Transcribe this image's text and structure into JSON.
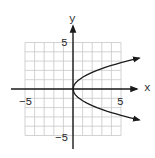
{
  "chart_data": {
    "type": "line",
    "title": "",
    "xlabel": "x",
    "ylabel": "y",
    "xlim": [
      -5,
      5
    ],
    "ylim": [
      -5,
      5
    ],
    "grid": true,
    "grid_step": 1,
    "x_tick_labels": [
      {
        "value": -5,
        "label": "−5"
      },
      {
        "value": 5,
        "label": "5"
      }
    ],
    "y_tick_labels": [
      {
        "value": 5,
        "label": "5"
      },
      {
        "value": -5,
        "label": "−5"
      }
    ],
    "series": [
      {
        "name": "parabola opening right (y² ≈ 1.6x)",
        "branches": [
          {
            "name": "upper-branch",
            "points": [
              [
                0,
                0
              ],
              [
                0.1,
                0.4
              ],
              [
                0.25,
                0.63
              ],
              [
                0.5,
                0.89
              ],
              [
                1,
                1.26
              ],
              [
                1.5,
                1.55
              ],
              [
                2,
                1.79
              ],
              [
                2.5,
                2.0
              ],
              [
                3,
                2.19
              ],
              [
                3.5,
                2.37
              ],
              [
                4,
                2.53
              ],
              [
                4.5,
                2.68
              ],
              [
                5,
                2.83
              ],
              [
                5.5,
                2.97
              ],
              [
                6,
                3.1
              ],
              [
                6.9,
                3.32
              ]
            ],
            "arrow_end": true
          },
          {
            "name": "lower-branch",
            "points": [
              [
                0,
                0
              ],
              [
                0.1,
                -0.4
              ],
              [
                0.25,
                -0.63
              ],
              [
                0.5,
                -0.89
              ],
              [
                1,
                -1.26
              ],
              [
                1.5,
                -1.55
              ],
              [
                2,
                -1.79
              ],
              [
                2.5,
                -2.0
              ],
              [
                3,
                -2.19
              ],
              [
                3.5,
                -2.37
              ],
              [
                4,
                -2.53
              ],
              [
                4.5,
                -2.68
              ],
              [
                5,
                -2.83
              ],
              [
                5.5,
                -2.97
              ],
              [
                6,
                -3.1
              ],
              [
                6.9,
                -3.32
              ]
            ],
            "arrow_end": true
          }
        ]
      }
    ],
    "axes_arrows": {
      "x_positive": true,
      "y_positive": true
    },
    "colors": {
      "grid": "#c8c8c8",
      "axis": "#1a1a1a",
      "curve": "#1a1a1a",
      "text": "#2a2a2a"
    }
  },
  "labels": {
    "x_axis": "x",
    "y_axis": "y",
    "x_min": "−5",
    "x_max": "5",
    "y_max": "5",
    "y_min": "−5"
  }
}
